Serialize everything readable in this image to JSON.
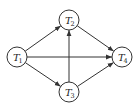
{
  "diagram": {
    "type": "directed-graph",
    "colors": {
      "stroke": "#333333",
      "fill": "#ffffff",
      "text": "#222222"
    },
    "nodes": [
      {
        "id": "T1",
        "base": "T",
        "sub": "1",
        "x": 17,
        "y": 57,
        "r": 10
      },
      {
        "id": "T2",
        "base": "T",
        "sub": "2",
        "x": 69,
        "y": 20,
        "r": 10
      },
      {
        "id": "T3",
        "base": "T",
        "sub": "3",
        "x": 69,
        "y": 92,
        "r": 10
      },
      {
        "id": "T4",
        "base": "T",
        "sub": "4",
        "x": 122,
        "y": 57,
        "r": 10
      }
    ],
    "edges": [
      {
        "from": "T1",
        "to": "T2"
      },
      {
        "from": "T1",
        "to": "T4"
      },
      {
        "from": "T1",
        "to": "T3"
      },
      {
        "from": "T3",
        "to": "T2"
      },
      {
        "from": "T2",
        "to": "T4"
      },
      {
        "from": "T3",
        "to": "T4"
      }
    ]
  }
}
